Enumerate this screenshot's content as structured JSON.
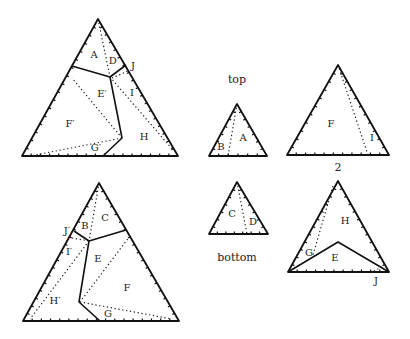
{
  "captions": {
    "top": "top",
    "bottom": "bottom",
    "number": "2"
  },
  "figures": {
    "top_left": {
      "triangle": [
        [
          98,
          19
        ],
        [
          22,
          156
        ],
        [
          178,
          156
        ]
      ],
      "solid": [
        [
          [
            72,
            66
          ],
          [
            110,
            77
          ],
          [
            126,
            65
          ]
        ],
        [
          [
            110,
            77
          ],
          [
            122,
            138
          ],
          [
            103,
            156
          ]
        ]
      ],
      "dotted": [
        [
          [
            98,
            19
          ],
          [
            110,
            77
          ]
        ],
        [
          [
            110,
            77
          ],
          [
            173,
            150
          ]
        ],
        [
          [
            112,
            78
          ],
          [
            128,
            71
          ]
        ],
        [
          [
            122,
            138
          ],
          [
            72,
            78
          ]
        ],
        [
          [
            122,
            138
          ],
          [
            30,
            156
          ]
        ]
      ],
      "labels": [
        {
          "t": "A",
          "x": 94,
          "y": 55
        },
        {
          "t": "D′",
          "x": 114,
          "y": 61
        },
        {
          "t": "J",
          "x": 133,
          "y": 66
        },
        {
          "t": "E′",
          "x": 102,
          "y": 94
        },
        {
          "t": "I",
          "x": 132,
          "y": 93
        },
        {
          "t": "F′",
          "x": 70,
          "y": 124
        },
        {
          "t": "H",
          "x": 144,
          "y": 137
        },
        {
          "t": "G′",
          "x": 96,
          "y": 148
        }
      ]
    },
    "bottom_left": {
      "triangle": [
        [
          99,
          183
        ],
        [
          23,
          321
        ],
        [
          179,
          321
        ]
      ],
      "solid": [
        [
          [
            74,
            231
          ],
          [
            89,
            241
          ],
          [
            126,
            230
          ]
        ],
        [
          [
            89,
            241
          ],
          [
            79,
            302
          ],
          [
            100,
            321
          ]
        ]
      ],
      "dotted": [
        [
          [
            99,
            183
          ],
          [
            89,
            241
          ]
        ],
        [
          [
            72,
            238
          ],
          [
            89,
            241
          ]
        ],
        [
          [
            89,
            241
          ],
          [
            30,
            319
          ]
        ],
        [
          [
            130,
            236
          ],
          [
            80,
            302
          ]
        ],
        [
          [
            80,
            302
          ],
          [
            172,
            319
          ]
        ]
      ],
      "labels": [
        {
          "t": "C",
          "x": 105,
          "y": 218
        },
        {
          "t": "B",
          "x": 85,
          "y": 226
        },
        {
          "t": "J′",
          "x": 67,
          "y": 231
        },
        {
          "t": "I′",
          "x": 69,
          "y": 252
        },
        {
          "t": "E",
          "x": 98,
          "y": 259
        },
        {
          "t": "F",
          "x": 127,
          "y": 288
        },
        {
          "t": "H′",
          "x": 55,
          "y": 301
        },
        {
          "t": "G",
          "x": 108,
          "y": 314
        }
      ]
    },
    "small_top": {
      "triangle": [
        [
          237,
          104
        ],
        [
          209,
          156
        ],
        [
          267,
          156
        ]
      ],
      "solid": [],
      "dotted": [
        [
          [
            237,
            104
          ],
          [
            228,
            156
          ]
        ]
      ],
      "labels": [
        {
          "t": "B",
          "x": 221,
          "y": 147
        },
        {
          "t": "A",
          "x": 243,
          "y": 138
        }
      ]
    },
    "small_bottom": {
      "triangle": [
        [
          237,
          182
        ],
        [
          209,
          234
        ],
        [
          268,
          234
        ]
      ],
      "solid": [],
      "dotted": [
        [
          [
            237,
            182
          ],
          [
            247,
            234
          ]
        ]
      ],
      "labels": [
        {
          "t": "C",
          "x": 232,
          "y": 214
        },
        {
          "t": "D",
          "x": 253,
          "y": 222
        }
      ]
    },
    "right_top": {
      "triangle": [
        [
          338,
          65
        ],
        [
          287,
          155
        ],
        [
          389,
          155
        ]
      ],
      "solid": [],
      "dotted": [
        [
          [
            338,
            65
          ],
          [
            368,
            155
          ]
        ]
      ],
      "labels": [
        {
          "t": "F",
          "x": 331,
          "y": 124
        },
        {
          "t": "I",
          "x": 372,
          "y": 138
        }
      ]
    },
    "right_bottom": {
      "triangle": [
        [
          338,
          181
        ],
        [
          288,
          272
        ],
        [
          389,
          272
        ]
      ],
      "solid": [
        [
          [
            288,
            272
          ],
          [
            338,
            242
          ],
          [
            389,
            272
          ]
        ]
      ],
      "dotted": [
        [
          [
            333,
            186
          ],
          [
            313,
            255
          ]
        ],
        [
          [
            382,
            267
          ],
          [
            372,
            272
          ]
        ]
      ],
      "labels": [
        {
          "t": "H",
          "x": 345,
          "y": 221
        },
        {
          "t": "G",
          "x": 309,
          "y": 253
        },
        {
          "t": "E",
          "x": 335,
          "y": 258
        },
        {
          "t": "J",
          "x": 376,
          "y": 281
        }
      ]
    }
  },
  "caption_positions": {
    "top": [
      237,
      80
    ],
    "bottom": [
      237,
      258
    ],
    "number": [
      338,
      168
    ]
  }
}
